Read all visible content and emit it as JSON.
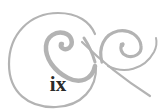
{
  "page": {
    "page_number": "ix",
    "ornament": "swirl-flourish-ornament",
    "ornament_color": "#b3b3b3",
    "text_color": "#2a2a2a"
  }
}
